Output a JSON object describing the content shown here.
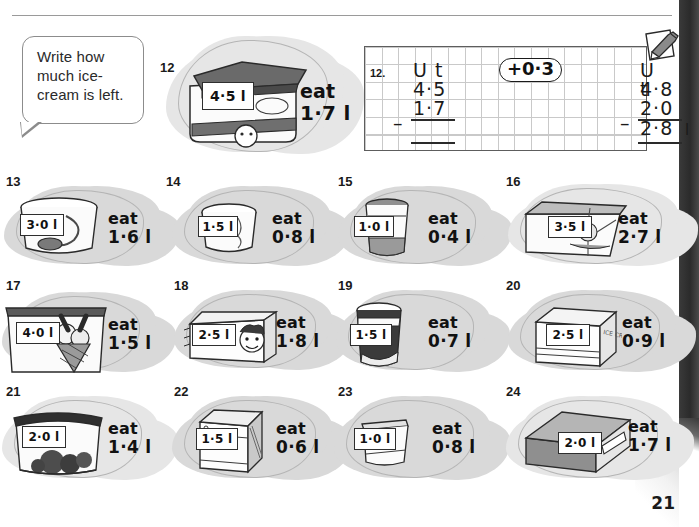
{
  "page": {
    "number": "21",
    "instruction": "Write how much ice-cream is left.",
    "eat_word": "eat"
  },
  "worked_example": {
    "number": "12.",
    "left": {
      "headers": "U t",
      "minuend": "4·5",
      "operator": "–",
      "subtrahend": "1·7",
      "answer": ""
    },
    "pill_label": "+0·3",
    "right": {
      "headers": "U t",
      "minuend": "4·8",
      "operator": "–",
      "subtrahend": "2·0",
      "answer": "2·8",
      "unit": "l"
    },
    "icon": "pencil-and-paper-icon"
  },
  "problems": [
    {
      "number": "12",
      "amount": "4·5 l",
      "eat": "1·7 l",
      "container": "rectangular-tub-with-lid"
    },
    {
      "number": "13",
      "amount": "3·0 l",
      "eat": "1·6 l",
      "container": "round-tub-with-scoop"
    },
    {
      "number": "14",
      "amount": "1·5 l",
      "eat": "0·8 l",
      "container": "small-round-tub"
    },
    {
      "number": "15",
      "amount": "1·0 l",
      "eat": "0·4 l",
      "container": "tall-cup"
    },
    {
      "number": "16",
      "amount": "3·5 l",
      "eat": "2·7 l",
      "container": "wide-box-with-lid"
    },
    {
      "number": "17",
      "amount": "4·0 l",
      "eat": "1·5 l",
      "container": "tub-with-cone"
    },
    {
      "number": "18",
      "amount": "2·5 l",
      "eat": "1·8 l",
      "container": "carton-with-face"
    },
    {
      "number": "19",
      "amount": "1·5 l",
      "eat": "0·7 l",
      "container": "dark-cup"
    },
    {
      "number": "20",
      "amount": "2·5 l",
      "eat": "0·9 l",
      "container": "square-box"
    },
    {
      "number": "21",
      "amount": "2·0 l",
      "eat": "1·4 l",
      "container": "tub-with-choc-chips"
    },
    {
      "number": "22",
      "amount": "1·5 l",
      "eat": "0·6 l",
      "container": "upright-carton"
    },
    {
      "number": "23",
      "amount": "1·0 l",
      "eat": "0·8 l",
      "container": "small-jar"
    },
    {
      "number": "24",
      "amount": "2·0 l",
      "eat": "1·7 l",
      "container": "long-box"
    }
  ]
}
